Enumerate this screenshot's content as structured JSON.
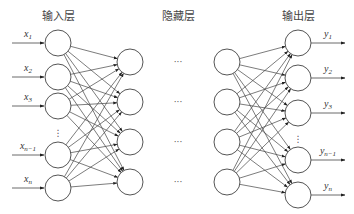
{
  "diagram": {
    "type": "neural-network",
    "titles": {
      "input": "输入层",
      "hidden": "隐藏层",
      "output": "输出层"
    },
    "inputs": [
      {
        "base": "x",
        "sub": "1"
      },
      {
        "base": "x",
        "sub": "2"
      },
      {
        "base": "x",
        "sub": "3"
      },
      {
        "base": "x",
        "sub": "n−1"
      },
      {
        "base": "x",
        "sub": "n"
      }
    ],
    "outputs": [
      {
        "base": "y",
        "sub": "1"
      },
      {
        "base": "y",
        "sub": "2"
      },
      {
        "base": "y",
        "sub": "3"
      },
      {
        "base": "y",
        "sub": "n−1"
      },
      {
        "base": "y",
        "sub": "n"
      }
    ],
    "vertical_ellipsis": "⋮",
    "horizontal_ellipsis": "···",
    "layout": {
      "input_x": 58,
      "input_ys": [
        43,
        77,
        106,
        155,
        188
      ],
      "hidden1_x": 130,
      "hidden_ys": [
        62,
        102,
        142,
        182
      ],
      "hidden2_x": 227,
      "output_x": 298,
      "output_ys": [
        43,
        78,
        113,
        160,
        195
      ],
      "radius": 13
    }
  }
}
